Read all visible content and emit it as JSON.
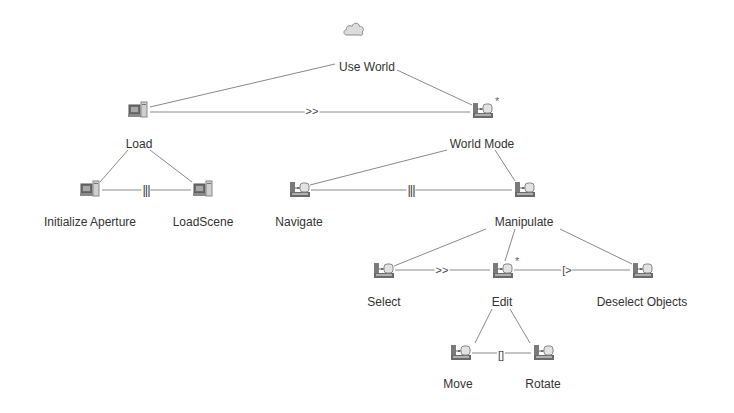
{
  "diagram": {
    "type": "task-model-tree",
    "colors": {
      "line": "#8a8a8a",
      "text": "#333333",
      "icon": "#8c8c8c",
      "background": "#ffffff"
    },
    "nodes": [
      {
        "id": "use-world",
        "label": "Use World",
        "icon": "cloud-icon",
        "x": 353,
        "y": 28,
        "lx": 367,
        "ly": 60,
        "iterative": false
      },
      {
        "id": "load",
        "label": "Load",
        "icon": "computer-icon",
        "x": 138,
        "y": 110,
        "lx": 139,
        "ly": 137,
        "iterative": false
      },
      {
        "id": "world-mode",
        "label": "World Mode",
        "icon": "interaction-icon",
        "x": 482,
        "y": 110,
        "lx": 482,
        "ly": 137,
        "iterative": true
      },
      {
        "id": "initialize-aperture",
        "label": "Initialize Aperture",
        "icon": "computer-icon",
        "x": 90,
        "y": 189,
        "lx": 90,
        "ly": 215,
        "iterative": false
      },
      {
        "id": "loadscene",
        "label": "LoadScene",
        "icon": "computer-icon",
        "x": 203,
        "y": 189,
        "lx": 203,
        "ly": 215,
        "iterative": false
      },
      {
        "id": "navigate",
        "label": "Navigate",
        "icon": "interaction-icon",
        "x": 299,
        "y": 189,
        "lx": 299,
        "ly": 215,
        "iterative": false
      },
      {
        "id": "manipulate",
        "label": "Manipulate",
        "icon": "interaction-icon",
        "x": 524,
        "y": 189,
        "lx": 524,
        "ly": 215,
        "iterative": false
      },
      {
        "id": "select",
        "label": "Select",
        "icon": "interaction-icon",
        "x": 383,
        "y": 270,
        "lx": 384,
        "ly": 295,
        "iterative": false
      },
      {
        "id": "edit",
        "label": "Edit",
        "icon": "interaction-icon",
        "x": 502,
        "y": 270,
        "lx": 502,
        "ly": 295,
        "iterative": true
      },
      {
        "id": "deselect-objects",
        "label": "Deselect Objects",
        "icon": "interaction-icon",
        "x": 642,
        "y": 270,
        "lx": 642,
        "ly": 295,
        "iterative": false
      },
      {
        "id": "move",
        "label": "Move",
        "icon": "interaction-icon",
        "x": 460,
        "y": 352,
        "lx": 458,
        "ly": 377,
        "iterative": false
      },
      {
        "id": "rotate",
        "label": "Rotate",
        "icon": "interaction-icon",
        "x": 543,
        "y": 352,
        "lx": 543,
        "ly": 377,
        "iterative": false
      }
    ],
    "parent_edges": [
      {
        "from": [
          335,
          64
        ],
        "to": [
          150,
          107
        ]
      },
      {
        "from": [
          397,
          70
        ],
        "to": [
          472,
          105
        ]
      },
      {
        "from": [
          128,
          150
        ],
        "to": [
          100,
          182
        ]
      },
      {
        "from": [
          150,
          150
        ],
        "to": [
          192,
          182
        ]
      },
      {
        "from": [
          447,
          150
        ],
        "to": [
          310,
          185
        ]
      },
      {
        "from": [
          495,
          150
        ],
        "to": [
          515,
          181
        ]
      },
      {
        "from": [
          486,
          229
        ],
        "to": [
          394,
          266
        ]
      },
      {
        "from": [
          515,
          229
        ],
        "to": [
          505,
          261
        ]
      },
      {
        "from": [
          560,
          229
        ],
        "to": [
          632,
          264
        ]
      },
      {
        "from": [
          492,
          309
        ],
        "to": [
          475,
          343
        ]
      },
      {
        "from": [
          510,
          309
        ],
        "to": [
          530,
          343
        ]
      }
    ],
    "operators": [
      {
        "symbol": ">>",
        "meaning": "enabling",
        "from": [
          150,
          112
        ],
        "to": [
          470,
          112
        ],
        "x": 312,
        "y": 111
      },
      {
        "symbol": "|||",
        "meaning": "interleaving",
        "from": [
          102,
          190
        ],
        "to": [
          191,
          190
        ],
        "x": 146,
        "y": 190
      },
      {
        "symbol": "|||",
        "meaning": "interleaving",
        "from": [
          311,
          190
        ],
        "to": [
          512,
          190
        ],
        "x": 411,
        "y": 190
      },
      {
        "symbol": ">>",
        "meaning": "enabling",
        "from": [
          395,
          270
        ],
        "to": [
          490,
          270
        ],
        "x": 442,
        "y": 270
      },
      {
        "symbol": "[>",
        "meaning": "deactivation",
        "from": [
          514,
          270
        ],
        "to": [
          630,
          270
        ],
        "x": 567,
        "y": 270
      },
      {
        "symbol": "[]",
        "meaning": "choice",
        "from": [
          472,
          353
        ],
        "to": [
          531,
          353
        ],
        "x": 501,
        "y": 355
      }
    ],
    "iteration_marker": "*"
  }
}
